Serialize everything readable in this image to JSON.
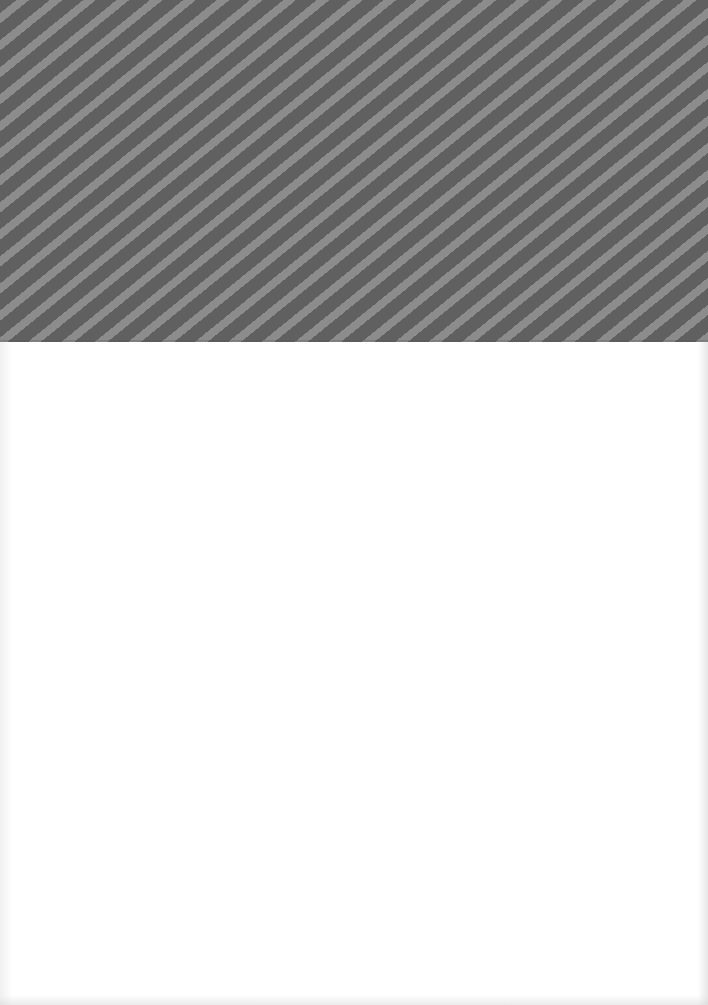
{
  "page": {
    "width": 708,
    "height": 1005,
    "background": "#ffffff"
  },
  "header_band": {
    "pattern": "diagonal-stripes",
    "height": 342,
    "dark_color": "#606060",
    "light_color": "#8c8c8c",
    "stripe_angle_deg": 39,
    "stripe_period_px": 21
  },
  "body_area": {
    "content": "",
    "color": "#ffffff"
  }
}
